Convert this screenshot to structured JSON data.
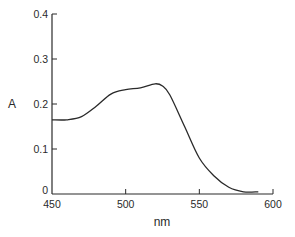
{
  "chart_data": {
    "type": "line",
    "title": "",
    "xlabel": "nm",
    "ylabel": "A",
    "xlim": [
      450,
      600
    ],
    "ylim": [
      0,
      0.4
    ],
    "grid": false,
    "legend": null,
    "x_ticks": [
      450,
      500,
      550,
      600
    ],
    "x_tick_labels": [
      "450",
      "500",
      "550",
      "600"
    ],
    "y_ticks": [
      0,
      0.1,
      0.2,
      0.3,
      0.4
    ],
    "y_tick_labels": [
      "0",
      "0.1",
      "0.2",
      "0.3",
      "0.4"
    ],
    "series": [
      {
        "name": "absorbance spectrum",
        "x": [
          450,
          460,
          470,
          480,
          490,
          500,
          510,
          520,
          525,
          530,
          540,
          550,
          560,
          570,
          580,
          590
        ],
        "y": [
          0.165,
          0.165,
          0.172,
          0.195,
          0.222,
          0.232,
          0.236,
          0.245,
          0.24,
          0.22,
          0.15,
          0.08,
          0.04,
          0.015,
          0.005,
          0.005
        ]
      }
    ],
    "line_color": "#2a2a2a"
  }
}
